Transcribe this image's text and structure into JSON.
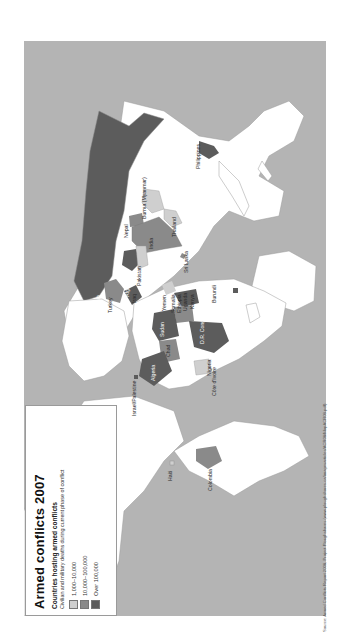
{
  "legend": {
    "title": "Armed conflicts 2007",
    "subtitle": "Countries hosting armed conflicts",
    "description": "Civilian and military deaths during current phase of conflict",
    "categories": [
      {
        "label": "1,000–10,000",
        "color": "#cfcfcf"
      },
      {
        "label": "10,000–100,000",
        "color": "#8a8a8a"
      },
      {
        "label": "Over 100,000",
        "color": "#5c5c5c"
      }
    ]
  },
  "colors": {
    "ocean": "#b4b4b4",
    "land": "#ffffff",
    "low": "#cfcfcf",
    "medium": "#8a8a8a",
    "high": "#5c5c5c",
    "border": "#9a9a9a"
  },
  "map": {
    "orientation": "rotated 90 degrees counter-clockwise (north to the left)",
    "labels": [
      {
        "name": "Russia",
        "level": "high"
      },
      {
        "name": "Philippines",
        "level": "high"
      },
      {
        "name": "Burma (Myanmar)",
        "level": "low"
      },
      {
        "name": "Nepal",
        "level": "medium"
      },
      {
        "name": "India",
        "level": "medium"
      },
      {
        "name": "Thailand",
        "level": "low"
      },
      {
        "name": "Sri Lanka",
        "level": "medium"
      },
      {
        "name": "Afghanistan",
        "level": "high"
      },
      {
        "name": "Pakistan",
        "level": "low"
      },
      {
        "name": "Turkey",
        "level": "medium"
      },
      {
        "name": "Iraq",
        "level": "high"
      },
      {
        "name": "Israel/Palestine",
        "level": "high"
      },
      {
        "name": "Yemen",
        "level": "low"
      },
      {
        "name": "Somalia",
        "level": "high"
      },
      {
        "name": "Ethiopia",
        "level": "medium"
      },
      {
        "name": "Uganda",
        "level": "high"
      },
      {
        "name": "Kenya",
        "level": "low"
      },
      {
        "name": "Burundi",
        "level": "high"
      },
      {
        "name": "Sudan",
        "level": "high"
      },
      {
        "name": "Chad",
        "level": "medium"
      },
      {
        "name": "D.R. Congo",
        "level": "high"
      },
      {
        "name": "Nigeria",
        "level": "low"
      },
      {
        "name": "Côte d'Ivoire",
        "level": "low"
      },
      {
        "name": "Algeria",
        "level": "high"
      },
      {
        "name": "Haiti",
        "level": "low"
      },
      {
        "name": "Colombia",
        "level": "medium"
      }
    ]
  },
  "source": "Source: Armed Conflicts Report 2008, Project Ploughshares (www.ploughshares.ca/imagesarticles/ACR08/MapACR08.pdf)"
}
